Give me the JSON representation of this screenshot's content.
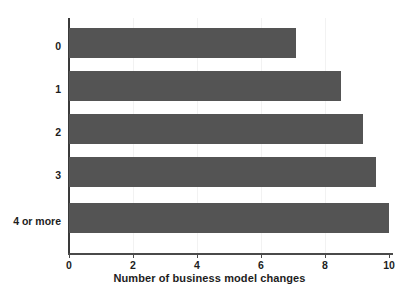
{
  "chart_data": {
    "type": "bar",
    "orientation": "horizontal",
    "title": "",
    "xlabel": "Number of business model changes",
    "ylabel": "",
    "categories": [
      "0",
      "1",
      "2",
      "3",
      "4 or more"
    ],
    "values": [
      7.1,
      8.5,
      9.2,
      9.6,
      10.0
    ],
    "xlim": [
      0,
      10
    ],
    "x_ticks": [
      0,
      2,
      4,
      6,
      8,
      10
    ],
    "x_tick_labels": [
      "0",
      "2",
      "4",
      "6",
      "8",
      "10"
    ],
    "grid": false,
    "legend": null,
    "bar_color": "#545454",
    "background_color": "#ffffff",
    "axis_color": "#4a4a4a"
  }
}
